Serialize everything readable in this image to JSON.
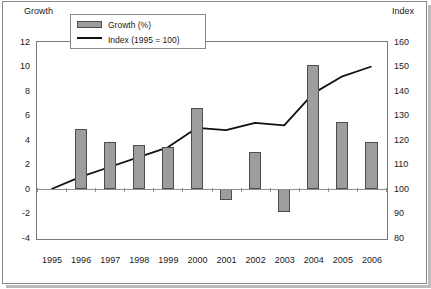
{
  "chart_data": {
    "type": "bar",
    "title": "",
    "categories": [
      "1995",
      "1996",
      "1997",
      "1998",
      "1999",
      "2000",
      "2001",
      "2002",
      "2003",
      "2004",
      "2005",
      "2006"
    ],
    "series": [
      {
        "name": "Growth (%)",
        "type": "bar",
        "axis": "left",
        "color": "#9d9d9d",
        "values": [
          0,
          4.9,
          3.8,
          3.6,
          3.4,
          6.6,
          -0.9,
          3.0,
          -1.85,
          10.1,
          5.5,
          3.8
        ]
      },
      {
        "name": "Index  (1995 = 100)",
        "type": "line",
        "axis": "right",
        "color": "#111111",
        "values": [
          100,
          105,
          109,
          113,
          117,
          125,
          124,
          127,
          126,
          139,
          146,
          150
        ]
      }
    ],
    "xlabel": "",
    "ylabel": "Growth",
    "y2label": "Index",
    "ylim": [
      -4,
      12
    ],
    "y2lim": [
      80,
      160
    ],
    "yticks": [
      "12",
      "10",
      "8",
      "6",
      "4",
      "2",
      "0",
      "-2",
      "-4"
    ],
    "y2ticks": [
      "160",
      "150",
      "140",
      "130",
      "120",
      "110",
      "100",
      "90",
      "80"
    ],
    "grid": false,
    "legend_position": "top-left"
  },
  "axes": {
    "left_title": "Growth",
    "right_title": "Index"
  },
  "legend": {
    "items": [
      {
        "label": "Growth (%)",
        "marker": "bar-swatch"
      },
      {
        "label": "Index  (1995 = 100)",
        "marker": "line-swatch"
      }
    ]
  }
}
